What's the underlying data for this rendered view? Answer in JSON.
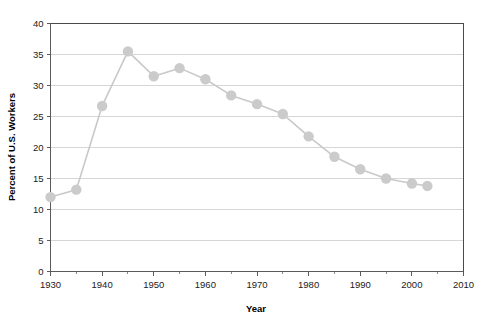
{
  "chart_data": {
    "type": "line",
    "title": "",
    "xlabel": "Year",
    "ylabel": "Percent of U.S. Workers",
    "xlim": [
      1930,
      2010
    ],
    "ylim": [
      0,
      40
    ],
    "xticks": [
      1930,
      1940,
      1950,
      1960,
      1970,
      1980,
      1990,
      2000,
      2010
    ],
    "xtick_labels": [
      "1930",
      "1940",
      "1950",
      "1960",
      "1970",
      "1980",
      "1990",
      "2000",
      "2010"
    ],
    "xminor_ticks": [
      1935,
      1945,
      1955,
      1965,
      1975,
      1985,
      1995,
      2005
    ],
    "yticks": [
      0,
      5,
      10,
      15,
      20,
      25,
      30,
      35,
      40
    ],
    "ytick_labels": [
      "0",
      "5",
      "10",
      "15",
      "20",
      "25",
      "30",
      "35",
      "40"
    ],
    "grid": "horizontal",
    "legend": "none",
    "marker": "circle",
    "series": [
      {
        "name": "Percent of U.S. Workers",
        "color": "#cbcbcb",
        "x": [
          1930,
          1935,
          1940,
          1945,
          1950,
          1955,
          1960,
          1965,
          1970,
          1975,
          1980,
          1985,
          1990,
          1995,
          2000,
          2003
        ],
        "values": [
          12.0,
          13.2,
          26.7,
          35.5,
          31.5,
          32.8,
          31.0,
          28.4,
          27.0,
          25.4,
          21.8,
          18.5,
          16.5,
          15.0,
          14.2,
          13.8
        ]
      }
    ]
  },
  "axis": {
    "x_title": "Year",
    "y_title": "Percent of U.S. Workers"
  },
  "colors": {
    "series": "#cbcbcb",
    "gridline": "#d6d6d6",
    "frame": "#4a4a4a",
    "text": "#1a1a1a",
    "background": "#ffffff"
  }
}
